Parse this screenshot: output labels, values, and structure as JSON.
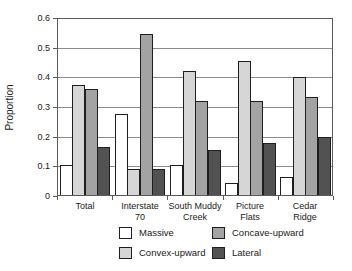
{
  "chart_data": {
    "type": "bar",
    "title": "",
    "ylabel": "Proportion",
    "xlabel": "",
    "ylim": [
      0,
      0.6
    ],
    "ytick_labels": [
      "0.6",
      "0.5",
      "0.4",
      "0.3",
      "0.2",
      "0.1",
      "0"
    ],
    "grid": "horizontal",
    "categories": [
      "Total",
      "Interstate\n70",
      "South Muddy\nCreek",
      "Picture\nFlats",
      "Cedar\nRidge"
    ],
    "series": [
      {
        "name": "Massive",
        "color": "#ffffff",
        "values": [
          0.105,
          0.275,
          0.105,
          0.045,
          0.065
        ]
      },
      {
        "name": "Convex-upward",
        "color": "#d6d6d6",
        "values": [
          0.375,
          0.09,
          0.42,
          0.455,
          0.4
        ]
      },
      {
        "name": "Concave-upward",
        "color": "#a3a3a3",
        "values": [
          0.36,
          0.545,
          0.32,
          0.32,
          0.335
        ]
      },
      {
        "name": "Lateral",
        "color": "#525252",
        "values": [
          0.165,
          0.09,
          0.155,
          0.18,
          0.2
        ]
      }
    ],
    "legend": {
      "position": "bottom",
      "columns": 2,
      "entries": [
        "Massive",
        "Concave-upward",
        "Convex-upward",
        "Lateral"
      ]
    }
  }
}
